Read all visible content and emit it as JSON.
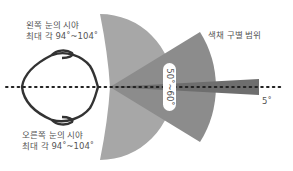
{
  "diagram": {
    "labels": {
      "left_eye_line1": "왼쪽 눈의 시야",
      "left_eye_line2": "최대 각 94˚~104˚",
      "right_eye_line1": "오른쪽 눈의 시야",
      "right_eye_line2": "최대 각 94˚~104˚",
      "color_range": "색채 구별 범위",
      "color_angle": "50˚~60˚",
      "focus_angle": "5˚"
    },
    "colors": {
      "wide_field": "#a7a7a7",
      "color_field": "#8c8c8c",
      "focus_field": "#6e6e6e",
      "outline": "#333333",
      "text": "#555555"
    },
    "icons": {
      "head": "head-top-view-icon"
    }
  }
}
